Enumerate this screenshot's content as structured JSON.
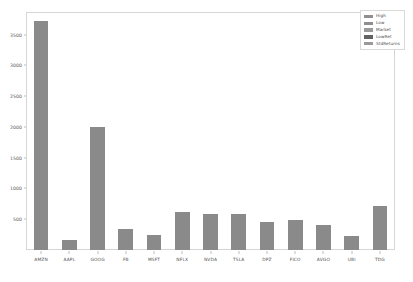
{
  "chart_data": {
    "type": "bar",
    "title": "",
    "xlabel": "",
    "ylabel": "",
    "categories": [
      "AMZN",
      "AAPL",
      "GOOG",
      "FB",
      "MSFT",
      "NFLX",
      "NVDA",
      "TSLA",
      "DPZ",
      "FICO",
      "AVGO",
      "UBI",
      "TDG"
    ],
    "values": [
      3720,
      155,
      2000,
      340,
      250,
      610,
      585,
      590,
      450,
      490,
      400,
      230,
      710
    ],
    "series": [
      {
        "name": "High",
        "values": [
          3720,
          155,
          2000,
          340,
          250,
          610,
          585,
          590,
          450,
          490,
          400,
          230,
          710
        ]
      }
    ],
    "ylim": [
      0,
      3850
    ],
    "yticks": [
      500,
      1000,
      1500,
      2000,
      2500,
      3000,
      3500
    ],
    "ytick_labels": [
      "500",
      "1000",
      "1500",
      "2000",
      "2500",
      "3000",
      "3500"
    ],
    "grid": false,
    "legend_position": "upper right",
    "legend": [
      "High",
      "Low",
      "Market",
      "LowRet",
      "StdReturns"
    ],
    "bar_color": "#8a8a8a"
  },
  "legend": {
    "entries": [
      {
        "label": "High",
        "color": "#8f8f8f"
      },
      {
        "label": "Low",
        "color": "#8f8f8f"
      },
      {
        "label": "Market",
        "color": "#9a9a9a"
      },
      {
        "label": "LowRet",
        "color": "#636363"
      },
      {
        "label": "StdReturns",
        "color": "#9a9a9a"
      }
    ]
  },
  "colors": {
    "bar": "#8a8a8a",
    "frame": "#d6d6d6",
    "tick_text": "#5a5a5a",
    "background": "#ffffff"
  }
}
